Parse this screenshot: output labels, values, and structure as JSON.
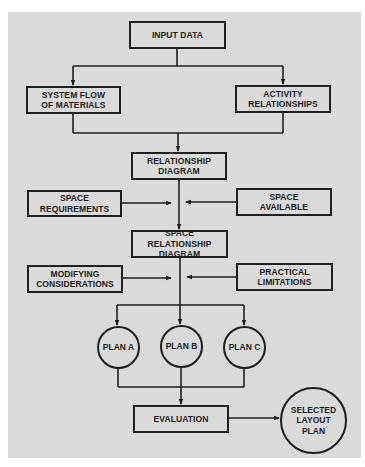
{
  "diagram": {
    "type": "flowchart",
    "colors": {
      "panel": "#dadada",
      "line": "#1e1e1e",
      "text": "#1a1a1a"
    },
    "nodes": {
      "input_data": "INPUT DATA",
      "system_flow": "SYSTEM FLOW\nOF MATERIALS",
      "activity_relationships": "ACTIVITY\nRELATIONSHIPS",
      "relationship_diagram": "RELATIONSHIP\nDIAGRAM",
      "space_requirements": "SPACE\nREQUIREMENTS",
      "space_available": "SPACE\nAVAILABLE",
      "space_relationship_diagram": "SPACE RELATIONSHIP\nDIAGRAM",
      "modifying_considerations": "MODIFYING\nCONSIDERATIONS",
      "practical_limitations": "PRACTICAL\nLIMITATIONS",
      "plan_a": "PLAN A",
      "plan_b": "PLAN B",
      "plan_c": "PLAN C",
      "evaluation": "EVALUATION",
      "selected_layout_plan": "SELECTED\nLAYOUT\nPLAN"
    },
    "edges": [
      [
        "input_data",
        "system_flow"
      ],
      [
        "input_data",
        "activity_relationships"
      ],
      [
        "system_flow",
        "relationship_diagram"
      ],
      [
        "activity_relationships",
        "relationship_diagram"
      ],
      [
        "relationship_diagram",
        "space_relationship_diagram"
      ],
      [
        "space_requirements",
        "space_relationship_diagram"
      ],
      [
        "space_available",
        "space_relationship_diagram"
      ],
      [
        "space_relationship_diagram",
        "plan_a"
      ],
      [
        "space_relationship_diagram",
        "plan_b"
      ],
      [
        "space_relationship_diagram",
        "plan_c"
      ],
      [
        "modifying_considerations",
        "plan_b"
      ],
      [
        "practical_limitations",
        "plan_b"
      ],
      [
        "plan_a",
        "evaluation"
      ],
      [
        "plan_b",
        "evaluation"
      ],
      [
        "plan_c",
        "evaluation"
      ],
      [
        "evaluation",
        "selected_layout_plan"
      ]
    ]
  }
}
